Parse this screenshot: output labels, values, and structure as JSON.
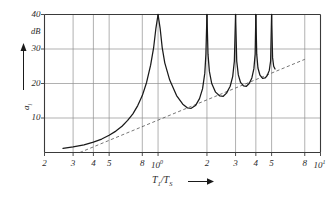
{
  "figure": {
    "background_color": "#ffffff",
    "axis_color": "#3a3a3a",
    "grid_color": "#8f8f8f",
    "curve_color": "#1a1a1a",
    "asymptote_color": "#4a4a4a"
  },
  "yaxis": {
    "label_symbol": "a",
    "label_subscript": "i",
    "unit": "dB",
    "ticks": [
      {
        "value": 40,
        "label": "40"
      },
      {
        "value": 30,
        "label": "30"
      },
      {
        "value": 20,
        "label": "20"
      },
      {
        "value": 10,
        "label": "10"
      }
    ]
  },
  "xaxis": {
    "label_main": "T",
    "label_sub1": "1",
    "label_div": "/T",
    "label_sub2": "S",
    "ticks": [
      {
        "value": 0.2,
        "label": "2",
        "decade": false
      },
      {
        "value": 0.3,
        "label": "3",
        "decade": false
      },
      {
        "value": 0.4,
        "label": "4",
        "decade": false
      },
      {
        "value": 0.5,
        "label": "5",
        "decade": false
      },
      {
        "value": 0.8,
        "label": "8",
        "decade": false
      },
      {
        "value": 1.0,
        "label": "10",
        "exp": "0",
        "decade": true
      },
      {
        "value": 2.0,
        "label": "2",
        "decade": false
      },
      {
        "value": 3.0,
        "label": "3",
        "decade": false
      },
      {
        "value": 4.0,
        "label": "4",
        "decade": false
      },
      {
        "value": 5.0,
        "label": "5",
        "decade": false
      },
      {
        "value": 8.0,
        "label": "8",
        "decade": false
      },
      {
        "value": 10.0,
        "label": "10",
        "exp": "1",
        "decade": true
      }
    ]
  },
  "chart_data": {
    "type": "line",
    "title": "",
    "xlabel": "T1/TS",
    "ylabel": "a_i",
    "yunit": "dB",
    "xscale": "log",
    "yscale": "linear",
    "xlim": [
      0.2,
      10.0
    ],
    "ylim": [
      0,
      40
    ],
    "grid": true,
    "legend_position": "none",
    "series": [
      {
        "name": "attenuation",
        "style": "solid",
        "description": "Attenuation curve with resonance poles at integer ratios, rising monotonically between poles",
        "resonance_poles_x": [
          1.0,
          2.0,
          3.0,
          4.0,
          5.0
        ],
        "points": [
          {
            "x": 0.26,
            "y": 1.2
          },
          {
            "x": 0.3,
            "y": 1.6
          },
          {
            "x": 0.35,
            "y": 2.2
          },
          {
            "x": 0.4,
            "y": 3.0
          },
          {
            "x": 0.45,
            "y": 3.9
          },
          {
            "x": 0.5,
            "y": 5.0
          },
          {
            "x": 0.55,
            "y": 6.2
          },
          {
            "x": 0.6,
            "y": 7.6
          },
          {
            "x": 0.65,
            "y": 9.3
          },
          {
            "x": 0.7,
            "y": 11.2
          },
          {
            "x": 0.75,
            "y": 13.6
          },
          {
            "x": 0.8,
            "y": 16.5
          },
          {
            "x": 0.85,
            "y": 20.3
          },
          {
            "x": 0.9,
            "y": 25.3
          },
          {
            "x": 0.94,
            "y": 30.5
          },
          {
            "x": 0.97,
            "y": 36.0
          },
          {
            "x": 1.0,
            "y": 40.0
          },
          {
            "x": 1.03,
            "y": 36.0
          },
          {
            "x": 1.06,
            "y": 30.5
          },
          {
            "x": 1.1,
            "y": 26.0
          },
          {
            "x": 1.18,
            "y": 21.0
          },
          {
            "x": 1.3,
            "y": 16.5
          },
          {
            "x": 1.42,
            "y": 14.0
          },
          {
            "x": 1.52,
            "y": 12.9
          },
          {
            "x": 1.6,
            "y": 12.8
          },
          {
            "x": 1.7,
            "y": 13.6
          },
          {
            "x": 1.8,
            "y": 15.6
          },
          {
            "x": 1.88,
            "y": 18.5
          },
          {
            "x": 1.94,
            "y": 23.0
          },
          {
            "x": 1.97,
            "y": 28.5
          },
          {
            "x": 2.0,
            "y": 40.0
          },
          {
            "x": 2.03,
            "y": 28.5
          },
          {
            "x": 2.07,
            "y": 23.5
          },
          {
            "x": 2.14,
            "y": 20.0
          },
          {
            "x": 2.26,
            "y": 17.5
          },
          {
            "x": 2.4,
            "y": 16.4
          },
          {
            "x": 2.52,
            "y": 16.3
          },
          {
            "x": 2.64,
            "y": 17.2
          },
          {
            "x": 2.78,
            "y": 19.2
          },
          {
            "x": 2.88,
            "y": 22.0
          },
          {
            "x": 2.95,
            "y": 26.5
          },
          {
            "x": 3.0,
            "y": 40.0
          },
          {
            "x": 3.05,
            "y": 26.5
          },
          {
            "x": 3.12,
            "y": 22.5
          },
          {
            "x": 3.22,
            "y": 20.3
          },
          {
            "x": 3.36,
            "y": 19.3
          },
          {
            "x": 3.5,
            "y": 19.2
          },
          {
            "x": 3.64,
            "y": 20.0
          },
          {
            "x": 3.78,
            "y": 21.6
          },
          {
            "x": 3.89,
            "y": 24.3
          },
          {
            "x": 3.96,
            "y": 28.5
          },
          {
            "x": 4.0,
            "y": 40.0
          },
          {
            "x": 4.05,
            "y": 28.5
          },
          {
            "x": 4.12,
            "y": 24.5
          },
          {
            "x": 4.24,
            "y": 22.4
          },
          {
            "x": 4.4,
            "y": 21.5
          },
          {
            "x": 4.56,
            "y": 21.6
          },
          {
            "x": 4.7,
            "y": 22.3
          },
          {
            "x": 4.84,
            "y": 23.8
          },
          {
            "x": 4.93,
            "y": 26.5
          },
          {
            "x": 5.0,
            "y": 40.0
          },
          {
            "x": 5.07,
            "y": 27.5
          },
          {
            "x": 5.15,
            "y": 25.0
          },
          {
            "x": 5.25,
            "y": 24.2
          }
        ]
      },
      {
        "name": "asymptote",
        "style": "dashed",
        "description": "Straight dashed reference line of constant slope on log axis",
        "points": [
          {
            "x": 0.33,
            "y": 0.0
          },
          {
            "x": 8.0,
            "y": 27.0
          }
        ]
      }
    ]
  }
}
